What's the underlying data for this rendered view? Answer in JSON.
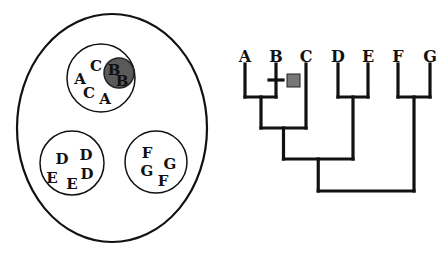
{
  "venn": {
    "outer": {
      "cx": 112,
      "cy": 128,
      "rx": 95,
      "ry": 114
    },
    "groups": [
      {
        "name": "ABC",
        "cx": 101,
        "cy": 78,
        "r": 34,
        "letters": [
          {
            "t": "C",
            "x": 96,
            "y": 71
          },
          {
            "t": "A",
            "x": 80,
            "y": 84
          },
          {
            "t": "C",
            "x": 89,
            "y": 98
          },
          {
            "t": "A",
            "x": 105,
            "y": 104
          }
        ],
        "highlight": {
          "cx": 119,
          "cy": 73,
          "r": 15,
          "fill": "#5a5a5a",
          "letters": [
            {
              "t": "B",
              "x": 114,
              "y": 75
            },
            {
              "t": "B",
              "x": 122,
              "y": 86
            }
          ]
        }
      },
      {
        "name": "DE",
        "cx": 72,
        "cy": 163,
        "r": 32,
        "letters": [
          {
            "t": "D",
            "x": 62,
            "y": 164
          },
          {
            "t": "D",
            "x": 86,
            "y": 160
          },
          {
            "t": "E",
            "x": 52,
            "y": 183
          },
          {
            "t": "E",
            "x": 72,
            "y": 189
          },
          {
            "t": "D",
            "x": 87,
            "y": 179
          }
        ]
      },
      {
        "name": "FG",
        "cx": 156,
        "cy": 162,
        "r": 31,
        "letters": [
          {
            "t": "F",
            "x": 147,
            "y": 158
          },
          {
            "t": "G",
            "x": 170,
            "y": 169
          },
          {
            "t": "G",
            "x": 147,
            "y": 176
          },
          {
            "t": "F",
            "x": 163,
            "y": 186
          }
        ]
      }
    ]
  },
  "tree": {
    "taxa": [
      {
        "label": "A",
        "x": 245
      },
      {
        "label": "B",
        "x": 276
      },
      {
        "label": "C",
        "x": 306
      },
      {
        "label": "D",
        "x": 338
      },
      {
        "label": "E",
        "x": 368
      },
      {
        "label": "F",
        "x": 398
      },
      {
        "label": "G",
        "x": 430
      }
    ],
    "label_y": 62,
    "tip_y": 64,
    "character_mark": {
      "taxon": "B",
      "y": 80,
      "box": {
        "x": 287,
        "y": 74,
        "w": 13,
        "h": 13,
        "fill": "#777777"
      }
    }
  }
}
